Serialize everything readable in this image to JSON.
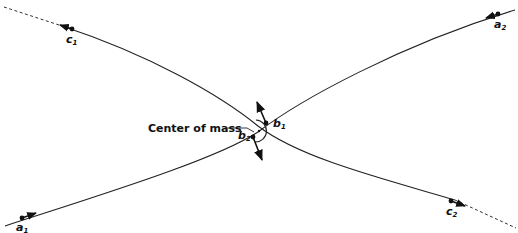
{
  "diagram": {
    "colors": {
      "ink": "#111111",
      "background": "#ffffff"
    },
    "labels": {
      "center_of_mass": "Center of mass",
      "c1": {
        "base": "c",
        "sub": "1"
      },
      "c2": {
        "base": "c",
        "sub": "2"
      },
      "a1": {
        "base": "a",
        "sub": "1"
      },
      "a2": {
        "base": "a",
        "sub": "2"
      },
      "b1": {
        "base": "b",
        "sub": "1"
      },
      "b2": {
        "base": "b",
        "sub": "2"
      }
    },
    "trajectories": [
      {
        "name": "body-1-path",
        "points": [
          "a1",
          "b1",
          "a2"
        ]
      },
      {
        "name": "body-2-path",
        "points": [
          "c1",
          "b2",
          "c2"
        ]
      }
    ]
  }
}
